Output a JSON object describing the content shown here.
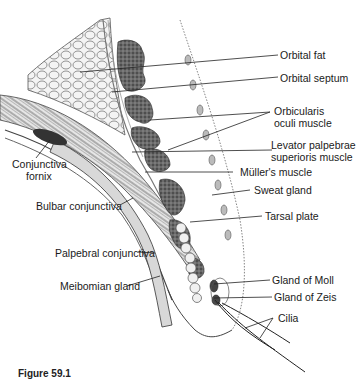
{
  "figure": {
    "caption": "Figure 59.1",
    "labels": {
      "orbital_fat": "Orbital fat",
      "orbital_septum": "Orbital septum",
      "orbicularis_1": "Orbicularis",
      "orbicularis_2": "oculi muscle",
      "levator_1": "Levator palpebrae",
      "levator_2": "superioris muscle",
      "muller": "Müller's muscle",
      "sweat_gland": "Sweat gland",
      "tarsal_plate": "Tarsal plate",
      "gland_moll": "Gland of Moll",
      "gland_zeis": "Gland of Zeis",
      "cilia": "Cilia",
      "conj_fornix_1": "Conjunctiva",
      "conj_fornix_2": "fornix",
      "bulbar_conj": "Bulbar conjunctiva",
      "palpebral_conj": "Palpebral conjunctiva",
      "meibomian_gland": "Meibomian gland"
    }
  }
}
